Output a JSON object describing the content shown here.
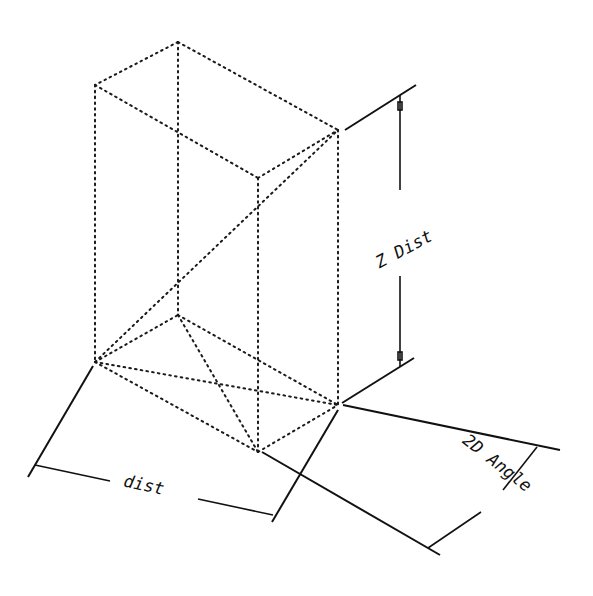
{
  "diagram": {
    "type": "isometric-box-dimension-drawing",
    "labels": {
      "z_dist": "Z Dist",
      "dist": "dist",
      "angle_2d": "2D Angle"
    },
    "colors": {
      "line": "#111111",
      "background": "#ffffff"
    }
  }
}
